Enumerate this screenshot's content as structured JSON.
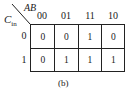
{
  "kmap": {
    "row_variable": {
      "name": "C",
      "subscript": "in"
    },
    "col_variable": "AB",
    "col_headers": [
      "00",
      "01",
      "11",
      "10"
    ],
    "row_headers": [
      "0",
      "1"
    ],
    "cells": [
      [
        "0",
        "0",
        "1",
        "0"
      ],
      [
        "0",
        "1",
        "1",
        "1"
      ]
    ],
    "caption": "(b)"
  }
}
